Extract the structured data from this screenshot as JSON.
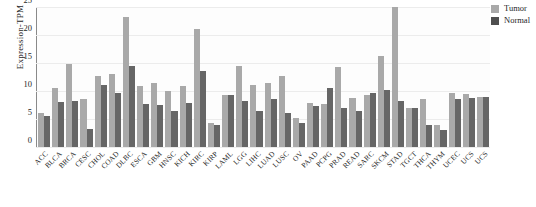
{
  "chart_data": {
    "type": "bar",
    "title": "",
    "xlabel": "",
    "ylabel": "Expression-TPM",
    "ylim": [
      0,
      25
    ],
    "yticks": [
      0,
      5,
      10,
      15,
      20,
      25
    ],
    "grid": true,
    "legend_position": "top-right",
    "categories": [
      "ACC",
      "BLCA",
      "BRCA",
      "CESC",
      "CHOL",
      "COAD",
      "DLBC",
      "ESCA",
      "GBM",
      "HNSC",
      "KICH",
      "KIRC",
      "KIRP",
      "LAML",
      "LGG",
      "LIHC",
      "LUAD",
      "LUSC",
      "OV",
      "PAAD",
      "PCPG",
      "PRAD",
      "READ",
      "SARC",
      "SKCM",
      "STAD",
      "TGCT",
      "THCA",
      "THYM",
      "UCEC",
      "UCS",
      "UCS2"
    ],
    "series": [
      {
        "name": "Tumor",
        "color": "#a9a9a9",
        "values": [
          6.0,
          10.6,
          14.8,
          8.5,
          12.6,
          13.0,
          23.3,
          10.9,
          11.5,
          10.0,
          10.9,
          21.0,
          4.3,
          9.3,
          14.5,
          11.0,
          11.5,
          12.6,
          5.2,
          7.8,
          7.6,
          14.2,
          8.8,
          9.2,
          16.2,
          25.0,
          6.9,
          8.5,
          4.0,
          9.7,
          9.4,
          9.0
        ]
      },
      {
        "name": "Normal",
        "color": "#666666",
        "values": [
          5.6,
          8.0,
          8.2,
          3.2,
          11.0,
          9.6,
          14.4,
          7.6,
          7.5,
          6.4,
          7.8,
          13.5,
          3.9,
          9.2,
          8.3,
          6.5,
          8.6,
          6.0,
          4.2,
          7.3,
          10.6,
          7.0,
          6.5,
          9.7,
          10.2,
          8.3,
          6.9,
          4.0,
          3.0,
          8.6,
          8.8,
          8.9
        ]
      }
    ]
  },
  "legend": {
    "items": [
      {
        "label": "Tumor"
      },
      {
        "label": "Normal"
      }
    ]
  },
  "caption": {
    "text": ""
  }
}
